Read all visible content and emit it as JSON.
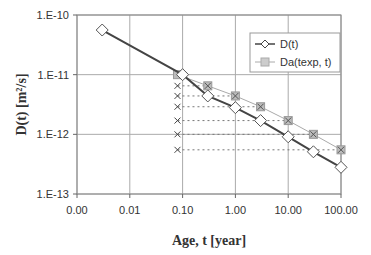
{
  "chart_data": {
    "type": "scatter",
    "title": "",
    "xlabel": "Age, t [year]",
    "ylabel": "D(t) [m²/s]",
    "xscale": "log",
    "yscale": "log",
    "xlim": [
      0.001,
      100
    ],
    "ylim": [
      1e-13,
      1e-10
    ],
    "x_ticks": [
      "0.00",
      "0.01",
      "0.10",
      "1.00",
      "10.00",
      "100.00"
    ],
    "x_tick_values": [
      0.001,
      0.01,
      0.1,
      1,
      10,
      100
    ],
    "y_ticks": [
      "1.E-10",
      "1.E-11",
      "1.E-12",
      "1.E-13"
    ],
    "y_tick_values": [
      1e-10,
      1e-11,
      1e-12,
      1e-13
    ],
    "grid": true,
    "legend_position": "upper right",
    "series": [
      {
        "name": "D(t)",
        "marker": "diamond-open",
        "line": "solid-dark",
        "x": [
          0.003,
          0.1,
          0.3,
          1,
          3,
          10,
          30,
          100
        ],
        "y": [
          5.6e-11,
          1e-11,
          4.4e-12,
          2.8e-12,
          1.7e-12,
          9.1e-13,
          5.1e-13,
          2.8e-13
        ]
      },
      {
        "name": "Da(texp, t)",
        "marker": "square-grey",
        "line": "solid-light",
        "x": [
          0.08,
          0.3,
          1,
          3,
          10,
          30,
          100
        ],
        "y": [
          1e-11,
          6.5e-12,
          4.4e-12,
          2.9e-12,
          1.7e-12,
          1e-12,
          5.5e-13
        ]
      }
    ],
    "annotations": {
      "description": "x markers at t≈0.08 with dotted horizontal guide lines extending to Da(texp, t) points",
      "x_marker_t": 0.08,
      "x_marker_y": [
        6.5e-12,
        4.4e-12,
        2.9e-12,
        1.7e-12,
        1e-12,
        5.5e-13
      ]
    }
  },
  "labels": {
    "y_axis_title": "D(t) [m²/s]",
    "x_axis_title": "Age, t [year]",
    "legend": [
      "D(t)",
      "Da(texp, t)"
    ]
  }
}
